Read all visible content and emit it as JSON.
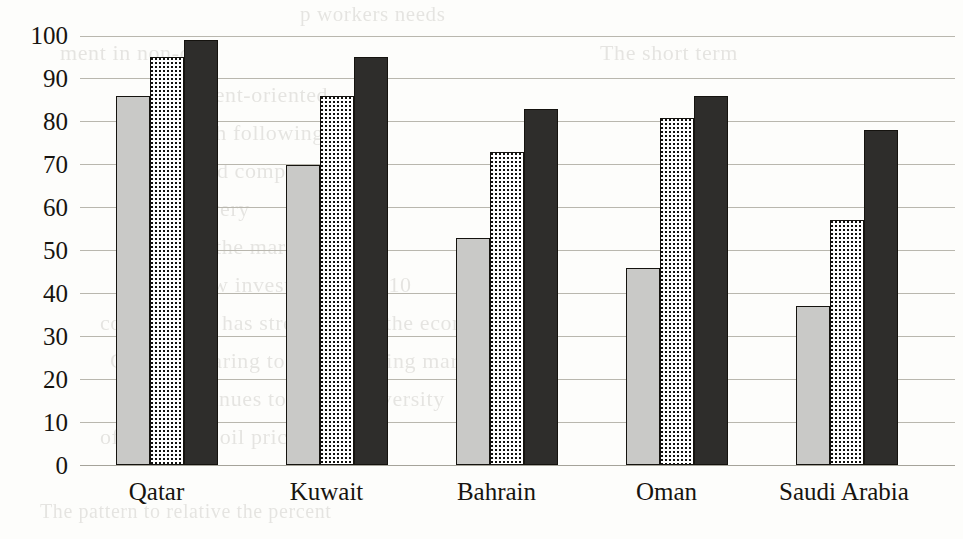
{
  "chart_data": {
    "type": "bar",
    "title": "",
    "subtitle": "",
    "xlabel": "",
    "ylabel": "",
    "ylim": [
      0,
      100
    ],
    "ytick_step": 10,
    "grid": true,
    "legend": false,
    "legend_position": "none",
    "orientation": "vertical",
    "grouping": "grouped",
    "categories": [
      "Qatar",
      "Kuwait",
      "Bahrain",
      "Oman",
      "Saudi Arabia"
    ],
    "ytick_labels": [
      "100",
      "90",
      "80",
      "70",
      "60",
      "50",
      "40",
      "30",
      "20",
      "10",
      "0"
    ],
    "series": [
      {
        "name": "series-1",
        "style": "light-gray-solid",
        "color": "#c9c9c7",
        "values": [
          86,
          70,
          53,
          46,
          37
        ]
      },
      {
        "name": "series-2",
        "style": "dotted-checker",
        "color": "#ffffff",
        "values": [
          95,
          86,
          73,
          81,
          57
        ]
      },
      {
        "name": "series-3",
        "style": "dark-solid",
        "color": "#2e2d2b",
        "values": [
          99,
          95,
          83,
          86,
          78
        ]
      }
    ],
    "annotations": []
  },
  "page": {
    "background_color": "#fdfdfb",
    "ink_color": "#17140f",
    "gridline_color": "#b9b7ae",
    "ghost_text_lines": [
      "p workers needs",
      "ment in non-oil",
      "The short term",
      "into agent-oriented",
      "exams with following p",
      "snow and competitiveness",
      "f and the very",
      "effect of the market",
      "recent view investment is 2010",
      "construction has strengthened the economy",
      "GDP comparing to Asia growing mar",
      "The continues to a more diversity",
      "of effects of oil prices of the",
      "The pattern to relative the percent"
    ]
  }
}
